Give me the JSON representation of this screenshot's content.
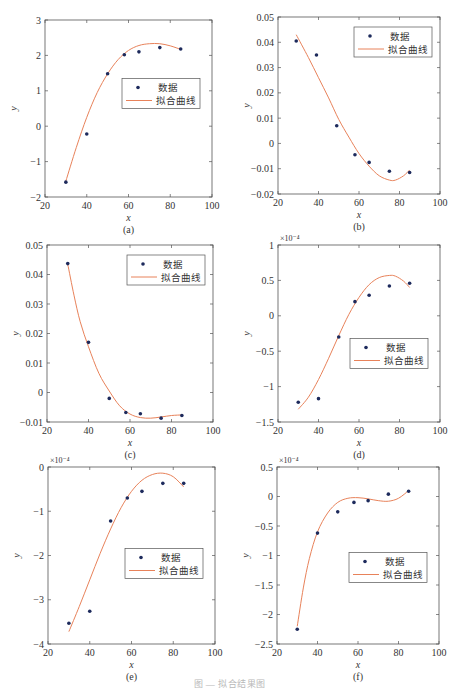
{
  "legend": {
    "data_label": "数据",
    "fit_label": "拟合曲线"
  },
  "colors": {
    "marker": "#1d2a5c",
    "fit": "#e8825a",
    "axis": "#555555",
    "text": "#333333"
  },
  "caption": "图 — 拟合结果图",
  "chart_data": [
    {
      "id": "a",
      "type": "scatter",
      "panel_label": "(a)",
      "title": "",
      "xlabel": "x",
      "ylabel": "y",
      "xlim": [
        20,
        100
      ],
      "ylim": [
        -2,
        3
      ],
      "xticks": [
        20,
        40,
        60,
        80,
        100
      ],
      "yticks": [
        -2,
        -1,
        0,
        1,
        2,
        3
      ],
      "ytick_labels": [
        "-2",
        "-1",
        "0",
        "1",
        "2",
        "3"
      ],
      "multiplier": "",
      "grid": false,
      "legend_position": "center-right",
      "series": [
        {
          "name": "数据",
          "kind": "markers",
          "x": [
            30,
            40,
            50,
            58,
            65,
            75,
            85
          ],
          "y": [
            -1.58,
            -0.22,
            1.48,
            2.02,
            2.1,
            2.22,
            2.18
          ]
        },
        {
          "name": "拟合曲线",
          "kind": "line",
          "x": [
            30,
            35,
            40,
            45,
            50,
            55,
            60,
            65,
            70,
            75,
            80,
            85
          ],
          "y": [
            -1.55,
            -0.6,
            0.25,
            0.95,
            1.48,
            1.88,
            2.14,
            2.28,
            2.33,
            2.33,
            2.27,
            2.17
          ]
        }
      ]
    },
    {
      "id": "b",
      "type": "scatter",
      "panel_label": "(b)",
      "title": "",
      "xlabel": "x",
      "ylabel": "y",
      "xlim": [
        20,
        100
      ],
      "ylim": [
        -0.02,
        0.05
      ],
      "xticks": [
        20,
        40,
        60,
        80,
        100
      ],
      "yticks": [
        -0.02,
        -0.01,
        0,
        0.01,
        0.02,
        0.03,
        0.04,
        0.05
      ],
      "ytick_labels": [
        "-0.02",
        "-0.01",
        "0",
        "0.01",
        "0.02",
        "0.03",
        "0.04",
        "0.05"
      ],
      "multiplier": "",
      "grid": false,
      "legend_position": "top-right",
      "series": [
        {
          "name": "数据",
          "kind": "markers",
          "x": [
            29,
            39,
            49,
            58,
            65,
            75,
            85
          ],
          "y": [
            0.0405,
            0.035,
            0.007,
            -0.0045,
            -0.0075,
            -0.011,
            -0.0115
          ]
        },
        {
          "name": "拟合曲线",
          "kind": "line",
          "x": [
            29,
            35,
            40,
            45,
            50,
            55,
            60,
            65,
            70,
            75,
            78,
            82,
            85
          ],
          "y": [
            0.043,
            0.034,
            0.026,
            0.018,
            0.0095,
            0.0025,
            -0.004,
            -0.009,
            -0.0128,
            -0.0145,
            -0.0145,
            -0.0128,
            -0.0105
          ]
        }
      ]
    },
    {
      "id": "c",
      "type": "scatter",
      "panel_label": "(c)",
      "title": "",
      "xlabel": "x",
      "ylabel": "y",
      "xlim": [
        20,
        100
      ],
      "ylim": [
        -0.01,
        0.05
      ],
      "xticks": [
        20,
        40,
        60,
        80,
        100
      ],
      "yticks": [
        -0.01,
        0,
        0.01,
        0.02,
        0.03,
        0.04,
        0.05
      ],
      "ytick_labels": [
        "-0.01",
        "0",
        "0.01",
        "0.02",
        "0.03",
        "0.04",
        "0.05"
      ],
      "multiplier": "",
      "grid": false,
      "legend_position": "top-right",
      "series": [
        {
          "name": "数据",
          "kind": "markers",
          "x": [
            30,
            40,
            50,
            58,
            65,
            75,
            85
          ],
          "y": [
            0.0437,
            0.017,
            -0.002,
            -0.0068,
            -0.0072,
            -0.0087,
            -0.0078
          ]
        },
        {
          "name": "拟合曲线",
          "kind": "line",
          "x": [
            30,
            33,
            36,
            40,
            45,
            50,
            55,
            60,
            65,
            70,
            75,
            80,
            85
          ],
          "y": [
            0.0435,
            0.033,
            0.024,
            0.0155,
            0.0065,
            0.0005,
            -0.0045,
            -0.0073,
            -0.0085,
            -0.0087,
            -0.0083,
            -0.0078,
            -0.0076
          ]
        }
      ]
    },
    {
      "id": "d",
      "type": "scatter",
      "panel_label": "(d)",
      "title": "",
      "xlabel": "x",
      "ylabel": "y",
      "xlim": [
        20,
        100
      ],
      "ylim": [
        -1.5,
        1
      ],
      "xticks": [
        20,
        40,
        60,
        80,
        100
      ],
      "yticks": [
        -1.5,
        -1,
        -0.5,
        0,
        0.5,
        1
      ],
      "ytick_labels": [
        "-1.5",
        "-1",
        "-0.5",
        "0",
        "0.5",
        "1"
      ],
      "multiplier": "×10⁻⁴",
      "grid": false,
      "legend_position": "center-right",
      "series": [
        {
          "name": "数据",
          "kind": "markers",
          "x": [
            30,
            40,
            50,
            58,
            65,
            75,
            85
          ],
          "y": [
            -1.22,
            -1.17,
            -0.3,
            0.2,
            0.29,
            0.42,
            0.46
          ]
        },
        {
          "name": "拟合曲线",
          "kind": "line",
          "x": [
            30,
            35,
            40,
            45,
            50,
            55,
            60,
            65,
            70,
            75,
            78,
            82,
            85
          ],
          "y": [
            -1.32,
            -1.15,
            -0.9,
            -0.6,
            -0.28,
            0.02,
            0.26,
            0.44,
            0.54,
            0.57,
            0.56,
            0.49,
            0.4
          ]
        }
      ]
    },
    {
      "id": "e",
      "type": "scatter",
      "panel_label": "(e)",
      "title": "",
      "xlabel": "x",
      "ylabel": "y",
      "xlim": [
        20,
        100
      ],
      "ylim": [
        -4,
        0
      ],
      "xticks": [
        20,
        40,
        60,
        80,
        100
      ],
      "yticks": [
        -4,
        -3,
        -2,
        -1,
        0
      ],
      "ytick_labels": [
        "-4",
        "-3",
        "-2",
        "-1",
        "0"
      ],
      "multiplier": "×10⁻⁴",
      "grid": false,
      "legend_position": "center-right",
      "series": [
        {
          "name": "数据",
          "kind": "markers",
          "x": [
            30,
            40,
            50,
            58,
            65,
            75,
            85
          ],
          "y": [
            -3.53,
            -3.26,
            -1.22,
            -0.7,
            -0.55,
            -0.37,
            -0.37
          ]
        },
        {
          "name": "拟合曲线",
          "kind": "line",
          "x": [
            30,
            35,
            40,
            45,
            50,
            55,
            60,
            65,
            70,
            75,
            80,
            85
          ],
          "y": [
            -3.72,
            -3.15,
            -2.55,
            -1.95,
            -1.4,
            -0.92,
            -0.55,
            -0.3,
            -0.17,
            -0.14,
            -0.22,
            -0.45
          ]
        }
      ]
    },
    {
      "id": "f",
      "type": "scatter",
      "panel_label": "(f)",
      "title": "",
      "xlabel": "x",
      "ylabel": "y",
      "xlim": [
        20,
        100
      ],
      "ylim": [
        -2.5,
        0.5
      ],
      "xticks": [
        20,
        40,
        60,
        80,
        100
      ],
      "yticks": [
        -2.5,
        -2,
        -1.5,
        -1,
        -0.5,
        0,
        0.5
      ],
      "ytick_labels": [
        "-2.5",
        "-2",
        "-1.5",
        "-1",
        "-0.5",
        "0",
        "0.5"
      ],
      "multiplier": "×10⁻⁴",
      "grid": false,
      "legend_position": "center-right",
      "series": [
        {
          "name": "数据",
          "kind": "markers",
          "x": [
            30,
            40,
            50,
            58,
            65,
            75,
            85
          ],
          "y": [
            -2.25,
            -0.62,
            -0.26,
            -0.1,
            -0.07,
            0.04,
            0.09
          ]
        },
        {
          "name": "拟合曲线",
          "kind": "line",
          "x": [
            30,
            33,
            36,
            40,
            45,
            50,
            55,
            60,
            65,
            70,
            75,
            80,
            85
          ],
          "y": [
            -2.2,
            -1.55,
            -1.05,
            -0.6,
            -0.28,
            -0.1,
            -0.03,
            -0.02,
            -0.04,
            -0.07,
            -0.08,
            -0.03,
            0.1
          ]
        }
      ]
    }
  ],
  "layout": {
    "panels": [
      {
        "id": "a",
        "left": 45,
        "top": 20,
        "width": 167,
        "height": 177
      },
      {
        "id": "b",
        "left": 278,
        "top": 17,
        "width": 162,
        "height": 177
      },
      {
        "id": "c",
        "left": 47,
        "top": 245,
        "width": 166,
        "height": 177
      },
      {
        "id": "d",
        "left": 278,
        "top": 245,
        "width": 162,
        "height": 177
      },
      {
        "id": "e",
        "left": 48,
        "top": 467,
        "width": 167,
        "height": 177
      },
      {
        "id": "f",
        "left": 277,
        "top": 467,
        "width": 162,
        "height": 177
      }
    ]
  }
}
